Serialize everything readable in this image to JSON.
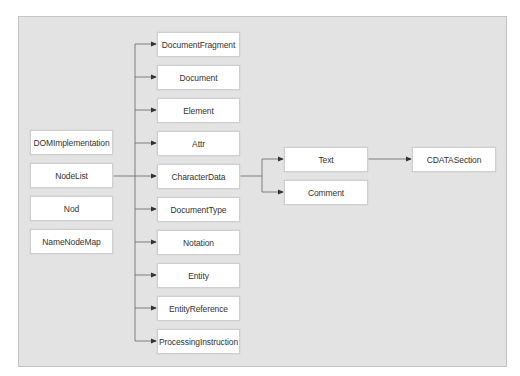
{
  "diagram": {
    "title": "",
    "left_column": [
      {
        "label": "DOMImplementation"
      },
      {
        "label": "NodeList"
      },
      {
        "label": "Nod"
      },
      {
        "label": "NameNodeMap"
      }
    ],
    "node_children": [
      {
        "label": "DocumentFragment"
      },
      {
        "label": "Document"
      },
      {
        "label": "Element"
      },
      {
        "label": "Attr"
      },
      {
        "label": "CharacterData"
      },
      {
        "label": "DocumentType"
      },
      {
        "label": "Notation"
      },
      {
        "label": "Entity"
      },
      {
        "label": "EntityReference"
      },
      {
        "label": "ProcessingInstruction"
      }
    ],
    "characterdata_children": [
      {
        "label": "Text"
      },
      {
        "label": "Comment"
      }
    ],
    "text_children": [
      {
        "label": "CDATASection"
      }
    ],
    "edges": [
      {
        "from": "NodeList",
        "to": "CharacterData"
      },
      {
        "from": "trunk",
        "to": "DocumentFragment"
      },
      {
        "from": "trunk",
        "to": "Document"
      },
      {
        "from": "trunk",
        "to": "Element"
      },
      {
        "from": "trunk",
        "to": "Attr"
      },
      {
        "from": "trunk",
        "to": "CharacterData"
      },
      {
        "from": "trunk",
        "to": "DocumentType"
      },
      {
        "from": "trunk",
        "to": "Notation"
      },
      {
        "from": "trunk",
        "to": "Entity"
      },
      {
        "from": "trunk",
        "to": "EntityReference"
      },
      {
        "from": "trunk",
        "to": "ProcessingInstruction"
      },
      {
        "from": "CharacterData",
        "to": "Text"
      },
      {
        "from": "CharacterData",
        "to": "Comment"
      },
      {
        "from": "Text",
        "to": "CDATASection"
      }
    ],
    "colors": {
      "background": "#e3e3e3",
      "box": "#ffffff",
      "line": "#555555"
    }
  }
}
